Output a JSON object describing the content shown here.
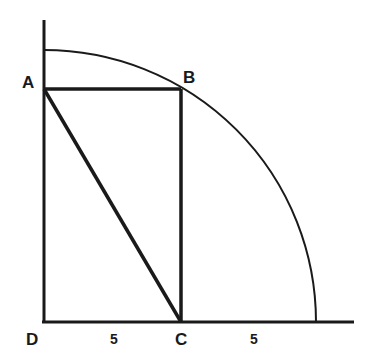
{
  "diagram": {
    "points": {
      "A": {
        "label": "A",
        "x": 44,
        "y": 89
      },
      "B": {
        "label": "B",
        "x": 181,
        "y": 89
      },
      "C": {
        "label": "C",
        "x": 181,
        "y": 322
      },
      "D": {
        "label": "D",
        "x": 44,
        "y": 322
      }
    },
    "segment_labels": {
      "DC": "5",
      "C_to_arc": "5"
    },
    "arc": {
      "center": "D",
      "radius_units": 10
    },
    "colors": {
      "stroke": "#1a1a1a",
      "background": "#ffffff"
    }
  }
}
